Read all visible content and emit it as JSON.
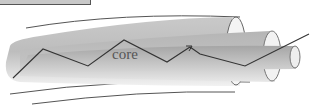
{
  "diagram": {
    "type": "optical-fiber-cross-section",
    "labels": {
      "core": "core"
    },
    "colors": {
      "jacket_fill": "#d9d9d9",
      "cladding_fill": "#c4c4c4",
      "core_fill": "#b0b0b0",
      "outline": "#555555",
      "ray": "#333333"
    }
  }
}
